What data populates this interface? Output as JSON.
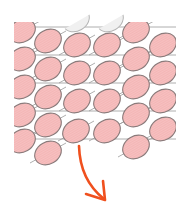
{
  "diagram": {
    "colors": {
      "background": "#ffffff",
      "ellipse_fill": "#f4b6b6",
      "ellipse_stroke": "#8a7a7a",
      "ghost_fill": "#f0f0f0",
      "ghost_stroke": "#b5b5b5",
      "grid_line": "#9a9a9a",
      "arrow": "#f0501e"
    },
    "ellipse": {
      "rx": 14,
      "ry": 11,
      "rotation": -30
    },
    "clip": {
      "x": 14,
      "y": 22,
      "w": 162,
      "h": 150
    },
    "ghost_ellipses": [
      {
        "cx": 76,
        "cy": 20
      },
      {
        "cx": 110,
        "cy": 20
      }
    ],
    "ellipses": [
      {
        "cx": 22,
        "cy": 31
      },
      {
        "cx": 22,
        "cy": 59
      },
      {
        "cx": 22,
        "cy": 87
      },
      {
        "cx": 22,
        "cy": 115
      },
      {
        "cx": 22,
        "cy": 141
      },
      {
        "cx": 48,
        "cy": 41
      },
      {
        "cx": 48,
        "cy": 69
      },
      {
        "cx": 48,
        "cy": 97
      },
      {
        "cx": 48,
        "cy": 125
      },
      {
        "cx": 48,
        "cy": 153
      },
      {
        "cx": 77,
        "cy": 45
      },
      {
        "cx": 77,
        "cy": 73
      },
      {
        "cx": 77,
        "cy": 101
      },
      {
        "cx": 76,
        "cy": 131
      },
      {
        "cx": 107,
        "cy": 45
      },
      {
        "cx": 107,
        "cy": 73
      },
      {
        "cx": 107,
        "cy": 101
      },
      {
        "cx": 107,
        "cy": 131
      },
      {
        "cx": 136,
        "cy": 31
      },
      {
        "cx": 136,
        "cy": 59
      },
      {
        "cx": 136,
        "cy": 87
      },
      {
        "cx": 136,
        "cy": 115
      },
      {
        "cx": 136,
        "cy": 147
      },
      {
        "cx": 163,
        "cy": 45
      },
      {
        "cx": 163,
        "cy": 73
      },
      {
        "cx": 163,
        "cy": 101
      },
      {
        "cx": 163,
        "cy": 129
      }
    ],
    "grid_lines_y": [
      27,
      55,
      83,
      111,
      139
    ],
    "arrow": {
      "path": "M 79 146 Q 80 180 104 199",
      "head": "M 86 194 L 105 200 L 103 181"
    }
  }
}
